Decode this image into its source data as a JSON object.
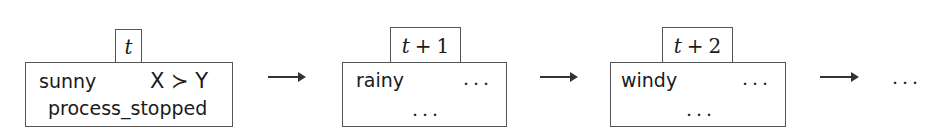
{
  "diagram": {
    "states": [
      {
        "time_label": {
          "var": "t",
          "op": "",
          "offset": ""
        },
        "line1_left": "sunny",
        "line1_right": "X ≻ Y",
        "line2": "process_stopped"
      },
      {
        "time_label": {
          "var": "t",
          "op": "+",
          "offset": "1"
        },
        "line1_left": "rainy",
        "line1_right": "...",
        "line2": "..."
      },
      {
        "time_label": {
          "var": "t",
          "op": "+",
          "offset": "2"
        },
        "line1_left": "windy",
        "line1_right": "...",
        "line2": "..."
      }
    ],
    "transitions": [
      {
        "from": 0,
        "to": 1,
        "icon": "right-arrow-icon"
      },
      {
        "from": 1,
        "to": 2,
        "icon": "right-arrow-icon"
      },
      {
        "from": 2,
        "to": "continuation",
        "icon": "right-arrow-icon"
      }
    ],
    "continuation": "..."
  }
}
